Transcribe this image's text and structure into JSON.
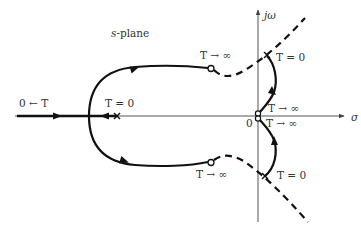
{
  "diagram": {
    "plane_label_var": "s",
    "plane_label_rest": "-plane",
    "axes": {
      "imag_label": "jω",
      "real_label": "σ",
      "origin_label": "0"
    },
    "labels": {
      "left_real": "0 ← T",
      "real_start": "T = 0",
      "upper_end": "T → ∞",
      "lower_end": "T → ∞",
      "upper_right_start": "T = 0",
      "lower_right_start": "T = 0",
      "origin_upper_end": "T → ∞",
      "origin_lower_end": "T → ∞"
    },
    "colors": {
      "stroke": "#111111",
      "axis": "#444444",
      "text": "#333333"
    }
  }
}
